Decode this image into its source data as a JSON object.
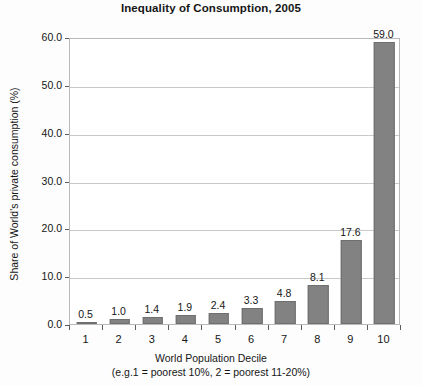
{
  "chart_data": {
    "type": "bar",
    "title": "Inequality of Consumption, 2005",
    "xlabel": "World Population Decile",
    "xsublabel": "(e.g.1 = poorest 10%, 2 = poorest 11-20%)",
    "ylabel": "Share of World's private consumption (%)",
    "categories": [
      "1",
      "2",
      "3",
      "4",
      "5",
      "6",
      "7",
      "8",
      "9",
      "10"
    ],
    "values": [
      0.5,
      1.0,
      1.4,
      1.9,
      2.4,
      3.3,
      4.8,
      8.1,
      17.6,
      59.0
    ],
    "value_labels": [
      "0.5",
      "1.0",
      "1.4",
      "1.9",
      "2.4",
      "3.3",
      "4.8",
      "8.1",
      "17.6",
      "59.0"
    ],
    "ylim": [
      0,
      60
    ],
    "yticks": [
      0,
      10,
      20,
      30,
      40,
      50,
      60
    ],
    "ytick_labels": [
      "0.0",
      "10.0",
      "20.0",
      "30.0",
      "40.0",
      "50.0",
      "60.0"
    ],
    "grid": true,
    "legend": false,
    "bar_color": "#828282",
    "bar_border_color": "#6f6f6f",
    "grid_color": "#c9c9c9",
    "axis_color": "#5d5d5d",
    "text_color": "#161616"
  }
}
